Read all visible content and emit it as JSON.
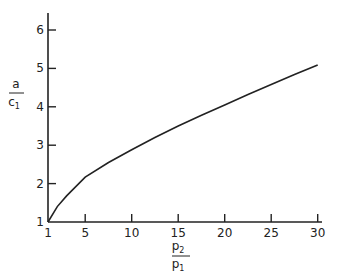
{
  "chart_data": {
    "type": "line",
    "title": "",
    "xlabel": "p2 / p1",
    "ylabel": "a / c1",
    "xlim": [
      1,
      30
    ],
    "ylim": [
      1,
      6.5
    ],
    "x_ticks": [
      "1",
      "5",
      "10",
      "15",
      "20",
      "25",
      "30"
    ],
    "y_ticks": [
      "1",
      "2",
      "3",
      "4",
      "5",
      "6"
    ],
    "grid": false,
    "legend": null,
    "series": [
      {
        "name": "a/c1",
        "x": [
          1,
          2,
          3,
          5,
          7.5,
          10,
          12.5,
          15,
          17.5,
          20,
          22.5,
          25,
          27.5,
          30
        ],
        "y": [
          1.0,
          1.4,
          1.68,
          2.17,
          2.55,
          2.88,
          3.2,
          3.5,
          3.78,
          4.05,
          4.32,
          4.58,
          4.84,
          5.09
        ]
      }
    ]
  },
  "axes": {
    "x_label_num": "p",
    "x_label_num_sub": "2",
    "x_label_den": "p",
    "x_label_den_sub": "1",
    "y_label_num": "a",
    "y_label_den": "c",
    "y_label_den_sub": "1"
  }
}
